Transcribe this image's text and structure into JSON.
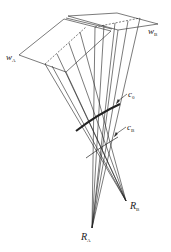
{
  "diagram": {
    "type": "projection-geometry",
    "labels": {
      "plane_a": {
        "main": "w",
        "sub": "A"
      },
      "plane_b": {
        "main": "w",
        "sub": "B"
      },
      "curve_0": {
        "main": "c",
        "sub": "0"
      },
      "curve_b": {
        "main": "c",
        "sub": "B"
      },
      "point_a": {
        "main": "R",
        "sub": "A"
      },
      "point_b": {
        "main": "R",
        "sub": "B"
      }
    },
    "colors": {
      "line": "#222222",
      "background": "#ffffff"
    }
  }
}
